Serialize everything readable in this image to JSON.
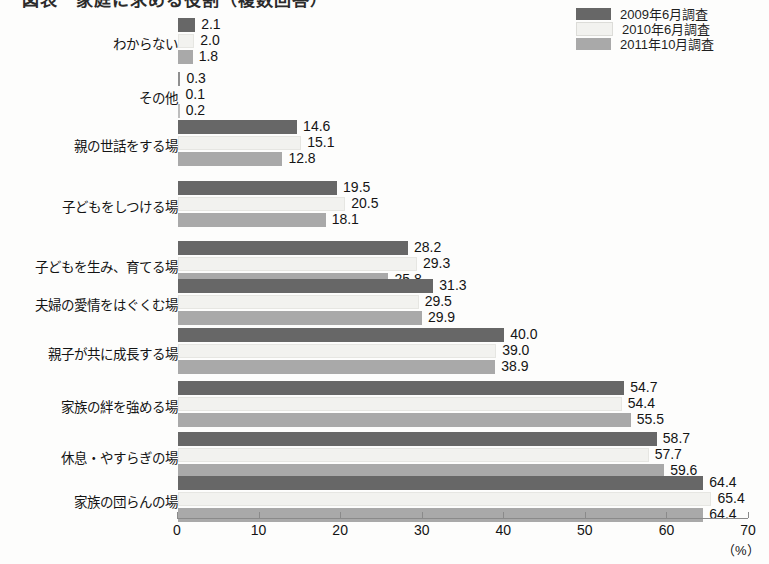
{
  "title": "図表　家庭に求める役割（複数回答）",
  "legend": {
    "position": "top-right",
    "entries": [
      {
        "label": "2009年6月調査",
        "color": "#676767"
      },
      {
        "label": "2010年6月調査",
        "color": "#f2f2ef"
      },
      {
        "label": "2011年10月調査",
        "color": "#a9a9a9"
      }
    ]
  },
  "axis": {
    "unit": "（%）",
    "ticks": [
      "0",
      "10",
      "20",
      "30",
      "40",
      "50",
      "60",
      "70"
    ]
  },
  "chart_data": {
    "type": "bar",
    "orientation": "horizontal",
    "title": "図表　家庭に求める役割（複数回答）",
    "xlabel": "（%）",
    "ylabel": "",
    "xlim": [
      0,
      70
    ],
    "grid": false,
    "legend_position": "top-right",
    "categories": [
      "わからない",
      "その他",
      "親の世話をする場",
      "子どもをしつける場",
      "子どもを生み、育てる場",
      "夫婦の愛情をはぐくむ場",
      "親子が共に成長する場",
      "家族の絆を強める場",
      "休息・やすらぎの場",
      "家族の団らんの場"
    ],
    "series": [
      {
        "name": "2009年6月調査",
        "color": "#676767",
        "values": [
          2.1,
          0.3,
          14.6,
          19.5,
          28.2,
          31.3,
          40.0,
          54.7,
          58.7,
          64.4
        ]
      },
      {
        "name": "2010年6月調査",
        "color": "#f2f2ef",
        "values": [
          2.0,
          0.1,
          15.1,
          20.5,
          29.3,
          29.5,
          39.0,
          54.4,
          57.7,
          65.4
        ]
      },
      {
        "name": "2011年10月調査",
        "color": "#a9a9a9",
        "values": [
          1.8,
          0.2,
          12.8,
          18.1,
          25.8,
          29.9,
          38.9,
          55.5,
          59.6,
          64.4
        ]
      }
    ],
    "value_labels": [
      [
        "2.1",
        "2.0",
        "1.8"
      ],
      [
        "0.3",
        "0.1",
        "0.2"
      ],
      [
        "14.6",
        "15.1",
        "12.8"
      ],
      [
        "19.5",
        "20.5",
        "18.1"
      ],
      [
        "28.2",
        "29.3",
        "25.8"
      ],
      [
        "31.3",
        "29.5",
        "29.9"
      ],
      [
        "40.0",
        "39.0",
        "38.9"
      ],
      [
        "54.7",
        "54.4",
        "55.5"
      ],
      [
        "58.7",
        "57.7",
        "59.6"
      ],
      [
        "64.4",
        "65.4",
        "64.4"
      ]
    ]
  }
}
